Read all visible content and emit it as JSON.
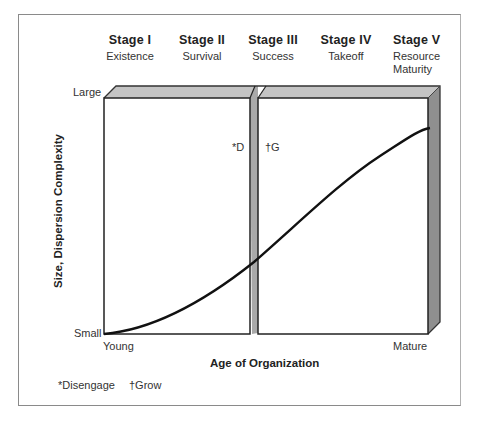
{
  "stages": [
    {
      "title": "Stage I",
      "subtitle": "Existence"
    },
    {
      "title": "Stage II",
      "subtitle": "Survival"
    },
    {
      "title": "Stage III",
      "subtitle": "Success"
    },
    {
      "title": "Stage IV",
      "subtitle": "Takeoff"
    },
    {
      "title": "Stage V",
      "subtitle": "Resource",
      "subtitle2": "Maturity"
    }
  ],
  "y_axis": {
    "title": "Size, Dispersion Complexity",
    "top_label": "Large",
    "bottom_label": "Small"
  },
  "x_axis": {
    "title": "Age of Organization",
    "left_label": "Young",
    "right_label": "Mature"
  },
  "divider_markers": {
    "left": "*D",
    "right": "†G"
  },
  "footnotes": [
    {
      "text": "*Disengage"
    },
    {
      "text": "†Grow"
    }
  ],
  "colors": {
    "box_shade": "#bdbdbd",
    "box_side": "#8e8e8e",
    "line": "#111111",
    "frame": "#8a8a8a"
  }
}
